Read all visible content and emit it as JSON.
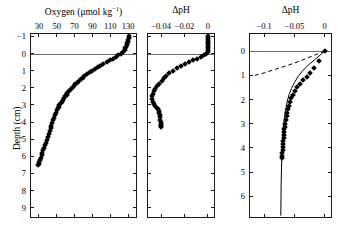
{
  "figure": {
    "width": 338,
    "height": 233,
    "background": "#ffffff",
    "marker_color": "#000000",
    "line_color": "#000000",
    "sediment_line_color": "#6a6a6a"
  },
  "panels": [
    {
      "id": "panel-oxygen",
      "x_title_main": "Oxygen (μmol kg",
      "x_title_sup": "−1",
      "x_title_tail": ")",
      "x_title_full": "Oxygen (μmol kg⁻¹)",
      "x_ticks": [
        "30",
        "50",
        "70",
        "90",
        "110",
        "130"
      ],
      "x_tick_values": [
        30,
        50,
        70,
        90,
        110,
        130
      ],
      "xlim": [
        20,
        140
      ],
      "y_title": "Depth (cm)",
      "y_ticks": [
        "−1",
        "0",
        "1",
        "2",
        "3",
        "4",
        "5",
        "6",
        "7",
        "8",
        "9"
      ],
      "y_tick_values": [
        -1,
        0,
        1,
        2,
        3,
        4,
        5,
        6,
        7,
        8,
        9
      ],
      "ylim": [
        -1.2,
        9.6
      ],
      "sediment_water_interface": 0
    },
    {
      "id": "panel-dph-narrow",
      "x_title_full": "ΔpH",
      "x_ticks": [
        "−0.04",
        "−0.02",
        "0"
      ],
      "x_tick_values": [
        -0.04,
        -0.02,
        0
      ],
      "xlim": [
        -0.052,
        0.006
      ],
      "ylim": [
        -1.2,
        9.6
      ],
      "sediment_water_interface": 0
    },
    {
      "id": "panel-dph-wide",
      "x_title_full": "ΔpH",
      "x_ticks": [
        "−0.1",
        "−0.05",
        "0"
      ],
      "x_tick_values": [
        -0.1,
        -0.05,
        0
      ],
      "xlim": [
        -0.125,
        0.012
      ],
      "y_ticks": [
        "0",
        "1",
        "2",
        "3",
        "4",
        "5",
        "6"
      ],
      "y_tick_values": [
        0,
        1,
        2,
        3,
        4,
        5,
        6
      ],
      "ylim": [
        -0.75,
        6.9
      ],
      "sediment_water_interface": 0
    }
  ],
  "chart_data": [
    {
      "type": "scatter",
      "title": "Oxygen (μmol kg⁻¹) depth profile",
      "xlabel": "Oxygen (μmol kg⁻¹)",
      "ylabel": "Depth (cm)",
      "xlim": [
        20,
        140
      ],
      "ylim": [
        -1.2,
        9.6
      ],
      "y_inverted": true,
      "grid": false,
      "legend": "none",
      "marker": "filled-diamond",
      "x": [
        131,
        131,
        130,
        130,
        129,
        129,
        128,
        127,
        126,
        124,
        122,
        119,
        116,
        113,
        110,
        106,
        102,
        99,
        96,
        93,
        90,
        87,
        84,
        81,
        79,
        77,
        75,
        73,
        71,
        69,
        67,
        65,
        64,
        62,
        61,
        59,
        58,
        57,
        56,
        55,
        53,
        52,
        51,
        50,
        49,
        48,
        47,
        46,
        45,
        44,
        43,
        42,
        41,
        40,
        39,
        38,
        37,
        36,
        35,
        34,
        33,
        32,
        31,
        30,
        30,
        29
      ],
      "y": [
        -1.0,
        -0.9,
        -0.8,
        -0.7,
        -0.6,
        -0.5,
        -0.4,
        -0.3,
        -0.2,
        -0.1,
        0.0,
        0.1,
        0.2,
        0.3,
        0.4,
        0.5,
        0.6,
        0.7,
        0.8,
        0.9,
        1.0,
        1.1,
        1.2,
        1.3,
        1.4,
        1.5,
        1.6,
        1.7,
        1.8,
        1.9,
        2.0,
        2.1,
        2.2,
        2.3,
        2.4,
        2.5,
        2.6,
        2.7,
        2.8,
        2.9,
        3.0,
        3.1,
        3.2,
        3.3,
        3.45,
        3.6,
        3.75,
        3.9,
        4.05,
        4.2,
        4.35,
        4.5,
        4.7,
        4.9,
        5.05,
        5.2,
        5.35,
        5.5,
        5.65,
        5.8,
        5.95,
        6.1,
        6.22,
        6.34,
        6.44,
        6.52
      ]
    },
    {
      "type": "scatter",
      "title": "ΔpH depth profile (narrow range)",
      "xlabel": "ΔpH",
      "ylabel": "Depth (cm)",
      "xlim": [
        -0.052,
        0.006
      ],
      "ylim": [
        -1.2,
        9.6
      ],
      "y_inverted": true,
      "grid": false,
      "legend": "none",
      "marker": "filled-diamond",
      "x": [
        0.0,
        0.0,
        0.0,
        0.0,
        0.0,
        0.0,
        0.0,
        0.0,
        0.0,
        0.0,
        -0.0015,
        -0.0035,
        -0.006,
        -0.009,
        -0.0125,
        -0.016,
        -0.0195,
        -0.023,
        -0.0265,
        -0.03,
        -0.033,
        -0.0355,
        -0.0375,
        -0.0395,
        -0.0415,
        -0.0435,
        -0.045,
        -0.0462,
        -0.047,
        -0.0475,
        -0.0478,
        -0.0472,
        -0.0462,
        -0.045,
        -0.0438,
        -0.0428,
        -0.042,
        -0.0414,
        -0.041,
        -0.0408,
        -0.0406,
        -0.0404,
        -0.0403,
        -0.0402,
        -0.0401,
        -0.04
      ],
      "y": [
        -1.0,
        -0.9,
        -0.8,
        -0.7,
        -0.6,
        -0.5,
        -0.4,
        -0.3,
        -0.2,
        -0.1,
        0.0,
        0.1,
        0.2,
        0.3,
        0.4,
        0.5,
        0.6,
        0.7,
        0.85,
        1.0,
        1.15,
        1.3,
        1.45,
        1.6,
        1.75,
        1.9,
        2.05,
        2.2,
        2.35,
        2.5,
        2.65,
        2.8,
        2.95,
        3.05,
        3.15,
        3.25,
        3.35,
        3.45,
        3.58,
        3.7,
        3.85,
        4.0,
        4.1,
        4.18,
        4.25,
        4.3
      ]
    },
    {
      "type": "scatter",
      "title": "ΔpH depth profile with model fit",
      "xlabel": "ΔpH",
      "ylabel": "Depth (cm)",
      "xlim": [
        -0.125,
        0.012
      ],
      "ylim": [
        -0.75,
        6.9
      ],
      "y_inverted": true,
      "grid": false,
      "legend": "none",
      "series": [
        {
          "name": "measured",
          "marker": "filled-diamond",
          "x": [
            0.0,
            -0.009,
            -0.018,
            -0.024,
            -0.03,
            -0.036,
            -0.041,
            -0.045,
            -0.049,
            -0.052,
            -0.055,
            -0.057,
            -0.059,
            -0.061,
            -0.062,
            -0.063,
            -0.064,
            -0.065,
            -0.066,
            -0.0665,
            -0.067,
            -0.0675,
            -0.068,
            -0.0685,
            -0.069,
            -0.0693,
            -0.0696,
            -0.07,
            -0.0702,
            -0.0705
          ],
          "y": [
            0.0,
            0.42,
            0.7,
            0.9,
            1.05,
            1.2,
            1.35,
            1.5,
            1.65,
            1.8,
            1.95,
            2.1,
            2.25,
            2.4,
            2.55,
            2.7,
            2.85,
            3.0,
            3.12,
            3.24,
            3.36,
            3.48,
            3.6,
            3.72,
            3.84,
            3.96,
            4.08,
            4.2,
            4.32,
            4.42
          ]
        },
        {
          "name": "model-solid",
          "style": "solid",
          "x": [
            0.0,
            -0.014,
            -0.026,
            -0.036,
            -0.044,
            -0.05,
            -0.055,
            -0.059,
            -0.062,
            -0.0645,
            -0.0663,
            -0.0677,
            -0.0688,
            -0.0697,
            -0.0704,
            -0.071,
            -0.0715,
            -0.0719,
            -0.0722,
            -0.0725
          ],
          "y": [
            0.0,
            0.3,
            0.55,
            0.8,
            1.05,
            1.3,
            1.55,
            1.8,
            2.1,
            2.4,
            2.7,
            3.0,
            3.35,
            3.7,
            4.1,
            4.5,
            5.0,
            5.5,
            6.1,
            6.8
          ]
        },
        {
          "name": "model-dashed",
          "style": "dashed",
          "x": [
            0.0,
            -0.012,
            -0.026,
            -0.042,
            -0.06,
            -0.08,
            -0.1,
            -0.118
          ],
          "y": [
            0.0,
            0.12,
            0.26,
            0.42,
            0.58,
            0.74,
            0.9,
            1.02
          ]
        }
      ]
    }
  ]
}
